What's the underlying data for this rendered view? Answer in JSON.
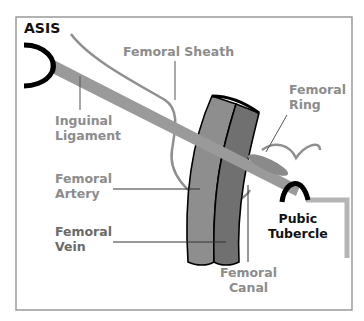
{
  "colors": {
    "frame": "#8a8a8a",
    "ligament": "#9a9a9a",
    "sheath": "#8f8f8f",
    "artery": "#8e8e8e",
    "vein": "#707070",
    "bone": "#000000",
    "pubic_line": "#b0b0b0",
    "label_grey": "#8c8c8c",
    "label_dark": "#6a6a6a",
    "label_black": "#111111"
  },
  "labels": {
    "asis": "ASIS",
    "femoral_sheath": "Femoral Sheath",
    "femoral_ring": {
      "line1": "Femoral",
      "line2": "Ring"
    },
    "inguinal_ligament": {
      "line1": "Inguinal",
      "line2": "Ligament"
    },
    "femoral_artery": {
      "line1": "Femoral",
      "line2": "Artery"
    },
    "femoral_vein": {
      "line1": "Femoral",
      "line2": "Vein"
    },
    "pubic_tubercle": {
      "line1": "Pubic",
      "line2": "Tubercle"
    },
    "femoral_canal": {
      "line1": "Femoral",
      "line2": "Canal"
    }
  }
}
